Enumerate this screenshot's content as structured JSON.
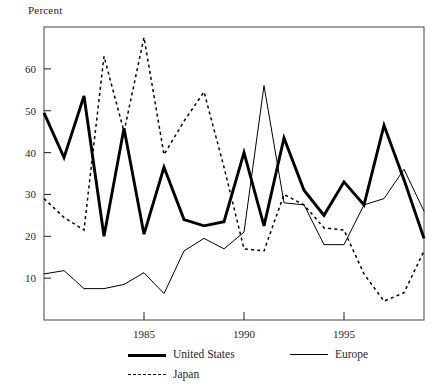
{
  "figure": {
    "y_axis_title": "Percent"
  },
  "legend": {
    "items": [
      {
        "label": "United States",
        "style": "thick-solid",
        "swatch": "line-swatch-thick"
      },
      {
        "label": "Europe",
        "style": "thin-solid",
        "swatch": "line-swatch-thin"
      },
      {
        "label": "Japan",
        "style": "dashed",
        "swatch": "line-swatch-dashed"
      }
    ]
  },
  "chart_data": {
    "type": "line",
    "title": "",
    "xlabel": "",
    "ylabel": "Percent",
    "xlim": [
      1980,
      1999
    ],
    "ylim": [
      0,
      70
    ],
    "grid": false,
    "legend_position": "bottom",
    "x": [
      1980,
      1981,
      1982,
      1983,
      1984,
      1985,
      1986,
      1987,
      1988,
      1989,
      1990,
      1991,
      1992,
      1993,
      1994,
      1995,
      1996,
      1997,
      1998,
      1999
    ],
    "xticks": [
      1985,
      1990,
      1995
    ],
    "xticklabels": [
      "1985",
      "1990",
      "1995"
    ],
    "yticks": [
      10,
      20,
      30,
      40,
      50,
      60
    ],
    "yticklabels": [
      "10",
      "20",
      "30",
      "40",
      "50",
      "60"
    ],
    "series": [
      {
        "name": "United States",
        "style": "thick-solid",
        "values": [
          49.5,
          38.8,
          53.5,
          20.0,
          45.8,
          20.5,
          36.5,
          24.0,
          22.5,
          23.5,
          40.0,
          22.5,
          43.5,
          31.0,
          25.0,
          33.0,
          27.5,
          46.5,
          33.5,
          19.5
        ]
      },
      {
        "name": "Europe",
        "style": "thin-solid",
        "values": [
          11.0,
          11.8,
          7.5,
          7.5,
          8.5,
          11.3,
          6.3,
          16.5,
          19.5,
          17.0,
          21.0,
          56.0,
          28.0,
          27.5,
          18.0,
          18.0,
          27.5,
          29.0,
          36.0,
          26.0
        ]
      },
      {
        "name": "Japan",
        "style": "dashed",
        "values": [
          29.0,
          24.5,
          21.5,
          63.0,
          45.0,
          67.5,
          39.5,
          47.5,
          54.5,
          36.5,
          17.0,
          16.5,
          30.0,
          27.5,
          22.0,
          21.5,
          11.0,
          4.5,
          6.5,
          16.5
        ]
      }
    ]
  }
}
